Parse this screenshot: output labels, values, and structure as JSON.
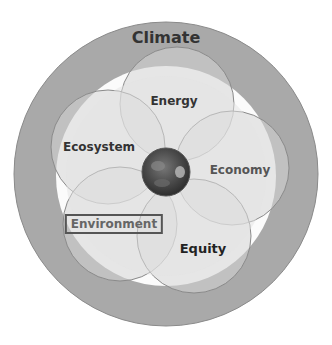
{
  "title_fragment": "",
  "diagram": {
    "outer_ring": {
      "label": "Climate",
      "color": "#a8a8a8"
    },
    "petals": [
      {
        "label": "Energy"
      },
      {
        "label": "Ecosystem"
      },
      {
        "label": "Economy"
      },
      {
        "label": "Environment",
        "boxed": true
      },
      {
        "label": "Equity"
      }
    ],
    "center": {
      "name": "earth-globe"
    },
    "colors": {
      "fill": "#dcdcdc",
      "overlap": "#c4c4c4",
      "stroke": "#8a8a8a",
      "center": "#4a4a4a"
    }
  }
}
